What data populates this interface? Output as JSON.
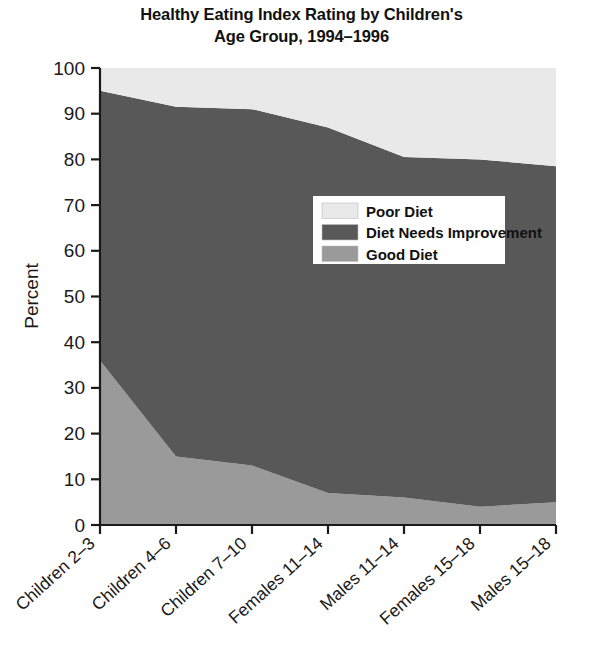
{
  "chart_data": {
    "type": "area",
    "title": "Healthy Eating Index Rating by Children's Age Group, 1994–1996",
    "title_line1": "Healthy Eating Index Rating by Children's",
    "title_line2": "Age Group, 1994–1996",
    "xlabel": "",
    "ylabel": "Percent",
    "ylim": [
      0,
      100
    ],
    "yticks": [
      0,
      10,
      20,
      30,
      40,
      50,
      60,
      70,
      80,
      90,
      100
    ],
    "ytick_labels": [
      "0",
      "10",
      "20",
      "30",
      "40",
      "50",
      "60",
      "70",
      "80",
      "90",
      "100"
    ],
    "grid": false,
    "stacked": true,
    "legend_position": "center",
    "categories": [
      "Children 2–3",
      "Children 4–6",
      "Children 7–10",
      "Females 11–14",
      "Males 11–14",
      "Females 15–18",
      "Males 15–18"
    ],
    "series": [
      {
        "name": "Good Diet",
        "color": "#9a9a9a",
        "values": [
          36,
          15,
          13,
          7,
          6,
          4,
          5
        ]
      },
      {
        "name": "Diet Needs Improvement",
        "color": "#585858",
        "values": [
          59,
          76.5,
          78,
          80,
          74.5,
          76,
          73.5
        ]
      },
      {
        "name": "Poor Diet",
        "color": "#e9e9e9",
        "values": [
          5,
          8.5,
          9,
          13,
          19.5,
          20,
          21.5
        ]
      }
    ],
    "cumulative_top_good": [
      36,
      15,
      13,
      7,
      6,
      4,
      5
    ],
    "cumulative_top_needs": [
      95,
      91.5,
      91,
      87,
      80.5,
      80,
      78.5
    ],
    "legend": [
      {
        "label": "Poor Diet",
        "color": "#e9e9e9"
      },
      {
        "label": "Diet Needs Improvement",
        "color": "#585858"
      },
      {
        "label": "Good Diet",
        "color": "#9a9a9a"
      }
    ]
  },
  "colors": {
    "poor_diet": "#e9e9e9",
    "diet_needs_improvement": "#585858",
    "good_diet": "#9a9a9a",
    "axis": "#1a1a1a",
    "text": "#111111",
    "legend_background": "#ffffff"
  }
}
